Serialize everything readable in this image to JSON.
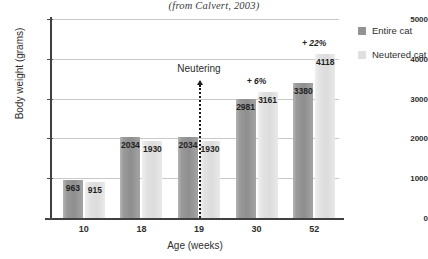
{
  "chart_data": {
    "type": "bar",
    "title": "(from Calvert, 2003)",
    "xlabel": "Age (weeks)",
    "ylabel": "Body weight (grams)",
    "categories": [
      "10",
      "18",
      "19",
      "30",
      "52"
    ],
    "ylim": [
      0,
      5000
    ],
    "yticks": [
      0,
      1000,
      2000,
      3000,
      4000,
      5000
    ],
    "ytick_labels": [
      "0",
      "1000",
      "2000",
      "3000",
      "4000",
      "5000"
    ],
    "grid": true,
    "legend_position": "right",
    "series": [
      {
        "name": "Entire cat",
        "color": "#939393",
        "values": [
          963,
          2034,
          2034,
          2981,
          3380
        ],
        "labels": [
          "963",
          "2034",
          "2034",
          "2981",
          "3380"
        ]
      },
      {
        "name": "Neutered cat",
        "color": "#e0e0e0",
        "values": [
          915,
          1930,
          1930,
          3161,
          4118
        ],
        "labels": [
          "915",
          "1930",
          "1930",
          "3161",
          "4118"
        ]
      }
    ],
    "annotations": [
      {
        "name": "neutering",
        "text": "Neutering",
        "at_category": "19"
      },
      {
        "name": "pct-30",
        "text": "+ 6%",
        "at_category": "30"
      },
      {
        "name": "pct-52",
        "text": "+ 22%",
        "at_category": "52"
      }
    ]
  }
}
